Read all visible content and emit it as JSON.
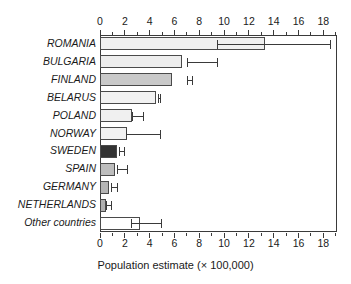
{
  "chart_data": {
    "type": "bar",
    "orientation": "horizontal",
    "title": "",
    "xlabel": "Population estimate (× 100,000)",
    "ylabel": "",
    "xlim": [
      0,
      19.1
    ],
    "xticks": [
      0,
      2,
      4,
      6,
      8,
      10,
      12,
      14,
      16,
      18
    ],
    "xtick_labels": [
      "0",
      "2",
      "4",
      "6",
      "8",
      "10",
      "12",
      "14",
      "16",
      "18"
    ],
    "minor_tick_step": 1,
    "axis_top": true,
    "axis_bottom": true,
    "grid": false,
    "legend": null,
    "categories": [
      "ROMANIA",
      "BULGARIA",
      "FINLAND",
      "BELARUS",
      "POLAND",
      "NORWAY",
      "SWEDEN",
      "SPAIN",
      "GERMANY",
      "NETHERLANDS",
      "Other countries"
    ],
    "values": [
      13.3,
      6.6,
      5.8,
      4.5,
      2.6,
      2.2,
      1.4,
      1.2,
      0.75,
      0.45,
      3.2
    ],
    "err_low": [
      9.4,
      7.0,
      7.0,
      4.7,
      2.6,
      2.1,
      1.5,
      1.4,
      0.9,
      0.5,
      2.5
    ],
    "err_high": [
      18.5,
      9.4,
      7.4,
      4.8,
      3.5,
      4.8,
      1.9,
      2.2,
      1.4,
      0.9,
      4.9
    ],
    "bar_colors": [
      "#f0f0f0",
      "#ededed",
      "#c9c9c9",
      "#f2f2f2",
      "#f0f0f0",
      "#f2f2f2",
      "#333333",
      "#bdbdbd",
      "#b5b5b5",
      "#b0b0b0",
      "#ffffff"
    ],
    "bar_edge_color": "#4a4a4a",
    "error_bar_color": "#3a3a3a",
    "axis_color": "#3a3a3a",
    "background_color": "#ffffff"
  },
  "axis": {
    "x_title": "Population estimate (× 100,000)"
  }
}
